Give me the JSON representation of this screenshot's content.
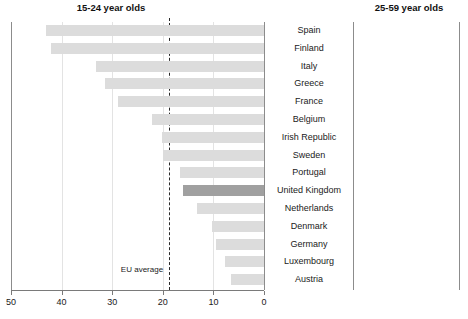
{
  "chart_data": {
    "type": "bar",
    "orientation": "horizontal",
    "panels": [
      {
        "id": "left",
        "title": "15-24 year olds",
        "xlabel": "",
        "ylabel": "",
        "xlim": [
          50,
          0
        ],
        "reversed": true,
        "ticks": [
          50,
          40,
          30,
          20,
          10,
          0
        ],
        "grid": true,
        "annotation": {
          "label": "EU average",
          "value": 18.8
        }
      },
      {
        "id": "right",
        "title": "25-59 year olds",
        "xlabel": "",
        "ylabel": "",
        "xlim": [
          0,
          20
        ],
        "reversed": false,
        "ticks": [
          0,
          10,
          20
        ],
        "grid": true,
        "annotation": {
          "label": "EU average",
          "value": 8.8
        }
      }
    ],
    "categories": [
      "Spain",
      "Finland",
      "Italy",
      "Greece",
      "France",
      "Belgium",
      "Irish Republic",
      "Sweden",
      "Portugal",
      "United Kingdom",
      "Netherlands",
      "Denmark",
      "Germany",
      "Luxembourg",
      "Austria"
    ],
    "highlight_category": "United Kingdom",
    "series": [
      {
        "name": "15-24 year olds",
        "panel": "left",
        "values": [
          43.0,
          42.0,
          33.2,
          31.4,
          28.8,
          22.2,
          20.2,
          20.0,
          16.6,
          16.0,
          13.2,
          10.2,
          9.4,
          7.8,
          6.6
        ]
      },
      {
        "name": "25-59 year olds",
        "panel": "right",
        "values": [
          19.0,
          13.5,
          8.5,
          7.3,
          10.0,
          8.2,
          10.4,
          6.0,
          6.0,
          7.1,
          5.8,
          6.0,
          8.0,
          2.4,
          4.0
        ]
      }
    ],
    "colors": {
      "bar": "#dcdcdc",
      "bar_highlight": "#a0a0a0",
      "grid": "#e3e3e3",
      "axis": "#7a7a7a",
      "text": "#1a1a1a",
      "average_line": "#2a2a2a"
    }
  }
}
